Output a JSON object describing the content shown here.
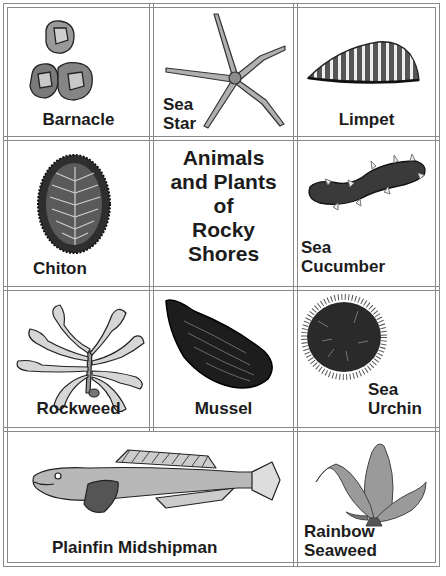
{
  "title": {
    "lines": [
      "Animals",
      "and Plants",
      "of",
      "Rocky",
      "Shores"
    ]
  },
  "cards": [
    {
      "id": "barnacle",
      "label_lines": [
        "Barnacle"
      ],
      "icon": "barnacle-illustration"
    },
    {
      "id": "sea-star",
      "label_lines": [
        "Sea",
        "Star"
      ],
      "icon": "sea-star-illustration"
    },
    {
      "id": "limpet",
      "label_lines": [
        "Limpet"
      ],
      "icon": "limpet-illustration"
    },
    {
      "id": "chiton",
      "label_lines": [
        "Chiton"
      ],
      "icon": "chiton-illustration"
    },
    {
      "id": "sea-cucumber",
      "label_lines": [
        "Sea",
        "Cucumber"
      ],
      "icon": "sea-cucumber-illustration"
    },
    {
      "id": "rockweed",
      "label_lines": [
        "Rockweed"
      ],
      "icon": "rockweed-illustration"
    },
    {
      "id": "mussel",
      "label_lines": [
        "Mussel"
      ],
      "icon": "mussel-illustration"
    },
    {
      "id": "sea-urchin",
      "label_lines": [
        "Sea",
        "Urchin"
      ],
      "icon": "sea-urchin-illustration"
    },
    {
      "id": "plainfin-midshipman",
      "label_lines": [
        "Plainfin Midshipman"
      ],
      "icon": "fish-illustration"
    },
    {
      "id": "rainbow-seaweed",
      "label_lines": [
        "Rainbow",
        "Seaweed"
      ],
      "icon": "seaweed-illustration"
    }
  ],
  "colors": {
    "grid_line": "#8a8a8a",
    "ink": "#1c1c1c",
    "background": "#ffffff"
  }
}
